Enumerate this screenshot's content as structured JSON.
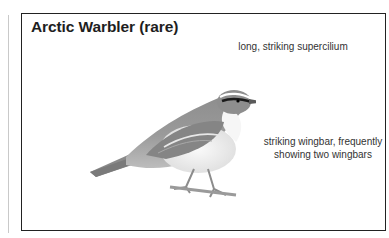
{
  "card": {
    "title": "Arctic Warbler (rare)",
    "annotations": [
      {
        "text": "long, striking supercilium"
      },
      {
        "text": "striking wingbar, frequently showing two wingbars"
      }
    ],
    "illustration": {
      "subject": "bird-illustration",
      "species": "Arctic Warbler"
    }
  },
  "colors": {
    "border": "#222222",
    "text": "#333333",
    "title": "#1e1e1e",
    "rule": "#c9c9c9"
  }
}
